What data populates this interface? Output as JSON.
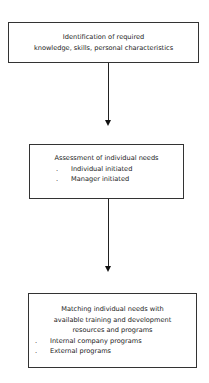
{
  "diagram": {
    "type": "flowchart",
    "direction": "top-to-bottom",
    "nodes": [
      {
        "id": "identification",
        "lines": [
          "Identification of required",
          "knowledge, skills, personal characteristics"
        ]
      },
      {
        "id": "assessment",
        "title": "Assessment of individual needs",
        "bullets": [
          "Individual initiated",
          "Manager initiated"
        ]
      },
      {
        "id": "matching",
        "lines": [
          "Matching individual needs with",
          "available training and development",
          "resources and programs"
        ],
        "bullets": [
          "Internal company programs",
          "External programs"
        ]
      }
    ],
    "edges": [
      {
        "from": "identification",
        "to": "assessment"
      },
      {
        "from": "assessment",
        "to": "matching"
      }
    ],
    "bullet_glyph": "."
  }
}
